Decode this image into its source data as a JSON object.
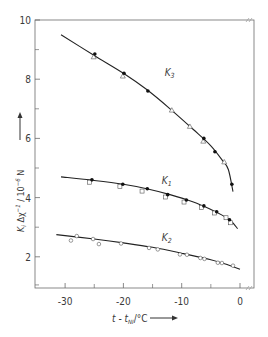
{
  "chart_data": {
    "type": "line",
    "title": "",
    "xlabel": "t - t_NI / °C",
    "ylabel": "K_i Δχ⁻¹ / 10⁻⁶ N",
    "xlim": [
      -35,
      2.4
    ],
    "ylim": [
      1,
      10
    ],
    "xticks": [
      -30,
      -20,
      -10,
      0
    ],
    "xminor": [
      -25,
      -15,
      -5
    ],
    "yticks": [
      2,
      4,
      6,
      8,
      10
    ],
    "yminor": [
      3,
      5,
      7,
      9
    ],
    "grid": false,
    "legend": "inline labels",
    "series": [
      {
        "name": "K3",
        "label_pos": [
          -15.5,
          8.1
        ],
        "curve": [
          [
            -30.7,
            9.5
          ],
          [
            -25,
            8.8
          ],
          [
            -20,
            8.2
          ],
          [
            -16,
            7.65
          ],
          [
            -12,
            7.0
          ],
          [
            -8,
            6.3
          ],
          [
            -5,
            5.75
          ],
          [
            -3,
            5.25
          ],
          [
            -2,
            4.95
          ],
          [
            -1.2,
            4.2
          ]
        ],
        "filled": [
          [
            -24.9,
            8.85
          ],
          [
            -19.9,
            8.2
          ],
          [
            -15.8,
            7.6
          ],
          [
            -6.2,
            6.0
          ],
          [
            -4.3,
            5.55
          ],
          [
            -1.4,
            4.45
          ]
        ],
        "triangles": [
          [
            -25.1,
            8.75
          ],
          [
            -20.1,
            8.1
          ],
          [
            -11.7,
            6.95
          ],
          [
            -8.6,
            6.4
          ],
          [
            -6.3,
            5.9
          ],
          [
            -2.7,
            5.2
          ]
        ]
      },
      {
        "name": "K1",
        "label_pos": [
          -16,
          4.45
        ],
        "curve": [
          [
            -30.7,
            4.7
          ],
          [
            -25,
            4.58
          ],
          [
            -20,
            4.45
          ],
          [
            -16,
            4.3
          ],
          [
            -12,
            4.1
          ],
          [
            -8,
            3.85
          ],
          [
            -5,
            3.6
          ],
          [
            -3,
            3.4
          ],
          [
            -1.5,
            3.2
          ],
          [
            -0.4,
            2.95
          ]
        ],
        "filled": [
          [
            -25.4,
            4.6
          ],
          [
            -20.1,
            4.45
          ],
          [
            -15.9,
            4.3
          ],
          [
            -12.4,
            4.1
          ],
          [
            -9.2,
            3.92
          ],
          [
            -6.2,
            3.72
          ],
          [
            -4.0,
            3.52
          ],
          [
            -1.8,
            3.25
          ]
        ],
        "squares": [
          [
            -25.8,
            4.52
          ],
          [
            -20.6,
            4.38
          ],
          [
            -16.8,
            4.22
          ],
          [
            -12.8,
            4.02
          ],
          [
            -9.6,
            3.85
          ],
          [
            -6.6,
            3.67
          ],
          [
            -4.4,
            3.48
          ],
          [
            -2.4,
            3.32
          ],
          [
            -1.6,
            3.15
          ]
        ]
      },
      {
        "name": "K2",
        "label_pos": [
          -16,
          2.55
        ],
        "curve": [
          [
            -31.5,
            2.75
          ],
          [
            -25,
            2.6
          ],
          [
            -20,
            2.47
          ],
          [
            -15,
            2.32
          ],
          [
            -10,
            2.12
          ],
          [
            -5,
            1.9
          ],
          [
            -2,
            1.72
          ],
          [
            0,
            1.58
          ]
        ],
        "open_circles": [
          [
            -29,
            2.55
          ],
          [
            -28,
            2.7
          ],
          [
            -25.2,
            2.6
          ],
          [
            -24.2,
            2.43
          ],
          [
            -20.4,
            2.45
          ],
          [
            -15.6,
            2.3
          ],
          [
            -14.1,
            2.25
          ],
          [
            -10.3,
            2.08
          ],
          [
            -9.1,
            2.07
          ],
          [
            -6.8,
            1.96
          ],
          [
            -6.1,
            1.93
          ],
          [
            -3.8,
            1.8
          ],
          [
            -3.1,
            1.79
          ],
          [
            -1.2,
            1.7
          ]
        ]
      }
    ]
  },
  "labels": {
    "ylabel_main": "K",
    "ylabel_rest": "Δχ",
    "ylabel_unit": "/ 10",
    "xlabel_t": "t - t",
    "xlabel_sub": "NI",
    "xlabel_unit": "/°C"
  }
}
